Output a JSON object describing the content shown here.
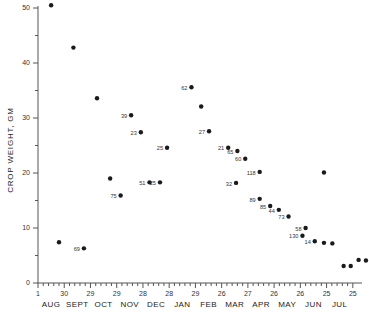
{
  "chart_data": {
    "type": "scatter",
    "title": "",
    "xlabel": "",
    "ylabel": "CROP WEIGHT, GM",
    "ylim": [
      0,
      50
    ],
    "ytick_values": [
      0,
      10,
      20,
      30,
      40,
      50
    ],
    "ytick_labels": [
      "0",
      "10",
      "20",
      "30",
      "40",
      "50"
    ],
    "yminor_step": 5,
    "grid": false,
    "legend": null,
    "xaxis": {
      "months": [
        "AUG",
        "SEPT",
        "OCT",
        "NOV",
        "DEC",
        "JAN",
        "FEB",
        "MAR",
        "APR",
        "MAY",
        "JUN",
        "JUL"
      ],
      "date_ticks": [
        "1",
        "30",
        "29",
        "29",
        "28",
        "28",
        "29",
        "26",
        "27",
        "26",
        "26",
        "25",
        "25"
      ],
      "minor_ticks_per_interval": 4
    },
    "point_label_note": "number beside marker is sample count",
    "points": [
      {
        "x": 0.2,
        "y": 50.5,
        "label": ""
      },
      {
        "x": 0.5,
        "y": 7.4,
        "label": ""
      },
      {
        "x": 1.05,
        "y": 42.8,
        "label": ""
      },
      {
        "x": 1.45,
        "y": 6.3,
        "label": "69"
      },
      {
        "x": 1.95,
        "y": 33.6,
        "label": ""
      },
      {
        "x": 2.45,
        "y": 19.0,
        "label": ""
      },
      {
        "x": 2.85,
        "y": 15.9,
        "label": "75"
      },
      {
        "x": 3.25,
        "y": 30.5,
        "label": "39"
      },
      {
        "x": 3.62,
        "y": 27.4,
        "label": "23"
      },
      {
        "x": 3.95,
        "y": 18.3,
        "label": "51"
      },
      {
        "x": 4.35,
        "y": 18.3,
        "label": "25"
      },
      {
        "x": 4.62,
        "y": 24.6,
        "label": "25"
      },
      {
        "x": 5.55,
        "y": 35.6,
        "label": "62"
      },
      {
        "x": 5.92,
        "y": 32.1,
        "label": ""
      },
      {
        "x": 6.22,
        "y": 27.6,
        "label": "27"
      },
      {
        "x": 6.95,
        "y": 24.6,
        "label": "21"
      },
      {
        "x": 7.3,
        "y": 24.0,
        "label": "65"
      },
      {
        "x": 7.6,
        "y": 22.6,
        "label": "60"
      },
      {
        "x": 7.25,
        "y": 18.2,
        "label": "32"
      },
      {
        "x": 8.15,
        "y": 20.2,
        "label": "118"
      },
      {
        "x": 8.15,
        "y": 15.3,
        "label": "89"
      },
      {
        "x": 8.55,
        "y": 14.0,
        "label": "85"
      },
      {
        "x": 8.88,
        "y": 13.3,
        "label": "44"
      },
      {
        "x": 9.25,
        "y": 12.1,
        "label": "73"
      },
      {
        "x": 9.9,
        "y": 10.0,
        "label": "58"
      },
      {
        "x": 9.78,
        "y": 8.6,
        "label": "130"
      },
      {
        "x": 10.25,
        "y": 7.6,
        "label": "14"
      },
      {
        "x": 10.6,
        "y": 7.3,
        "label": ""
      },
      {
        "x": 10.92,
        "y": 7.2,
        "label": ""
      },
      {
        "x": 10.6,
        "y": 20.1,
        "label": ""
      },
      {
        "x": 11.35,
        "y": 3.1,
        "label": ""
      },
      {
        "x": 11.62,
        "y": 3.1,
        "label": ""
      },
      {
        "x": 11.92,
        "y": 4.2,
        "label": ""
      },
      {
        "x": 12.2,
        "y": 4.1,
        "label": ""
      }
    ]
  }
}
